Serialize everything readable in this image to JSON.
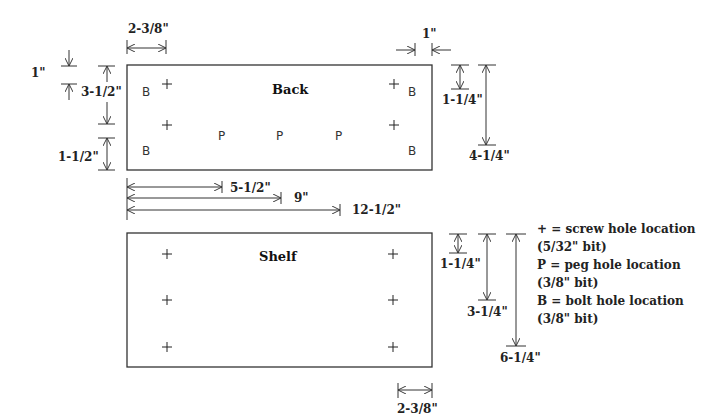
{
  "boards": {
    "back": {
      "title": "Back",
      "marks": {
        "bolt": "B",
        "peg": "P",
        "screw": "+"
      }
    },
    "shelf": {
      "title": "Shelf",
      "marks": {
        "screw": "+"
      }
    }
  },
  "dimensions": {
    "back_left_hole_offset": "2-3/8\"",
    "back_right_bolt_offset": "1\"",
    "back_top_bolt_offset": "1\"",
    "back_screw_spacing": "3-1/2\"",
    "back_bottom_bolt_offset": "1-1/2\"",
    "back_right_top_screw": "1-1/4\"",
    "back_right_lower_screw": "4-1/4\"",
    "peg_1": "5-1/2\"",
    "peg_2": "9\"",
    "peg_3": "12-1/2\"",
    "shelf_top_screw": "1-1/4\"",
    "shelf_mid_screw": "3-1/4\"",
    "shelf_bottom_screw": "6-1/4\"",
    "shelf_right_offset": "2-3/8\""
  },
  "legend": {
    "screw_line1": "+ = screw hole location",
    "screw_line2": "(5/32\" bit)",
    "peg_line1": "P = peg hole location",
    "peg_line2": "(3/8\" bit)",
    "bolt_line1": "B = bolt hole location",
    "bolt_line2": "(3/8\" bit)"
  }
}
